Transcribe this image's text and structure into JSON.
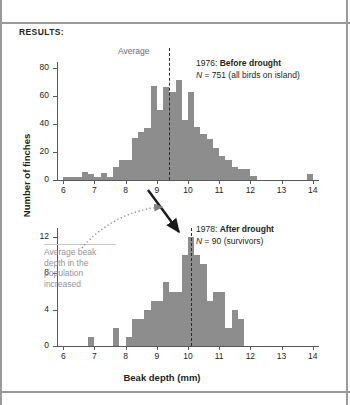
{
  "figure": {
    "results_label": "RESULTS:",
    "y_axis_title": "Number of finches",
    "x_axis_title": "Beak depth (mm)",
    "average_caption": "Average",
    "annotation_note": "Average beak depth in the population increased",
    "bar_color": "#8d8d8d",
    "note_color": "#939598"
  },
  "panel_top": {
    "legend_year": "1976:",
    "legend_title": "Before drought",
    "legend_n_prefix": "N",
    "legend_n_value": " = 751 (all birds on island)",
    "y_ticks": [
      "0",
      "20",
      "40",
      "60",
      "80"
    ],
    "x_ticks": [
      "6",
      "7",
      "8",
      "9",
      "10",
      "11",
      "12",
      "13",
      "14"
    ]
  },
  "panel_bottom": {
    "legend_year": "1978:",
    "legend_title": "After drought",
    "legend_n_prefix": "N",
    "legend_n_value": " = 90 (survivors)",
    "y_ticks": [
      "0",
      "4",
      "8",
      "12"
    ],
    "x_ticks": [
      "6",
      "7",
      "8",
      "9",
      "10",
      "11",
      "12",
      "13",
      "14"
    ]
  },
  "chart_data": [
    {
      "type": "bar",
      "title": "1976: Before drought",
      "subtitle": "N = 751 (all birds on island)",
      "xlabel": "Beak depth (mm)",
      "ylabel": "Number of finches",
      "xlim": [
        5.8,
        14.2
      ],
      "ylim": [
        0,
        84
      ],
      "bin_width": 0.2,
      "grid": false,
      "mean_marker": 9.4,
      "mean_marker_label": "Average",
      "categories": [
        6.0,
        6.2,
        6.4,
        6.6,
        6.8,
        7.0,
        7.2,
        7.4,
        7.6,
        7.8,
        8.0,
        8.2,
        8.4,
        8.6,
        8.8,
        9.0,
        9.2,
        9.4,
        9.6,
        9.8,
        10.0,
        10.2,
        10.4,
        10.6,
        10.8,
        11.0,
        11.2,
        11.4,
        11.6,
        11.8,
        12.0,
        12.2,
        12.4,
        12.6,
        12.8,
        13.0,
        13.2,
        13.4,
        13.6,
        13.8
      ],
      "values": [
        2,
        2,
        2,
        6,
        4,
        2,
        5,
        2,
        9,
        14,
        14,
        30,
        34,
        37,
        67,
        50,
        66,
        63,
        71,
        43,
        63,
        38,
        33,
        29,
        23,
        17,
        14,
        9,
        8,
        8,
        3,
        0,
        0,
        0,
        0,
        0,
        0,
        0,
        0,
        4
      ]
    },
    {
      "type": "bar",
      "title": "1978: After drought",
      "subtitle": "N = 90 (survivors)",
      "xlabel": "Beak depth (mm)",
      "ylabel": "Number of finches",
      "xlim": [
        5.8,
        14.2
      ],
      "ylim": [
        0,
        13
      ],
      "bin_width": 0.2,
      "grid": false,
      "mean_marker": 10.1,
      "categories": [
        6.0,
        6.2,
        6.4,
        6.6,
        6.8,
        7.0,
        7.2,
        7.4,
        7.6,
        7.8,
        8.0,
        8.2,
        8.4,
        8.6,
        8.8,
        9.0,
        9.2,
        9.4,
        9.6,
        9.8,
        10.0,
        10.2,
        10.4,
        10.6,
        10.8,
        11.0,
        11.2,
        11.4,
        11.6,
        11.8,
        12.0
      ],
      "values": [
        0,
        0,
        0,
        0,
        1,
        0,
        0,
        0,
        2,
        0,
        1,
        3,
        3,
        4,
        5,
        5,
        7,
        6,
        6,
        10,
        12,
        10,
        9,
        5,
        6,
        6,
        2,
        4,
        3,
        0,
        0
      ]
    }
  ]
}
